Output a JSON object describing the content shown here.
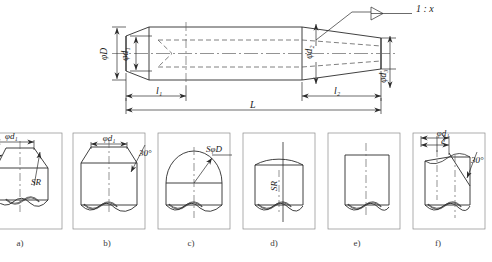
{
  "drawing": {
    "title": "taper-pin-engineering-drawing",
    "line_color": "#2b2b2b",
    "hidden_line_color": "#555555",
    "center_line_color": "#666666",
    "background": "#ffffff"
  },
  "main_view": {
    "name": "taper-pin-main-view",
    "taper_callout": "1 : x",
    "dimensions": {
      "outer_diameter": "φD",
      "left_inner_diameter": "φd₁",
      "right_diameter_2": "φd₂",
      "right_diameter_3": "φd₃",
      "length_left": "l₁",
      "length_right": "l₂",
      "overall_length": "L"
    }
  },
  "detail_views": [
    {
      "id": "a",
      "caption": "a)",
      "labels": [
        "φd₁",
        "SR"
      ],
      "description": "chamfered-end-with-spherical-radius"
    },
    {
      "id": "b",
      "caption": "b)",
      "labels": [
        "φd₁",
        "30°"
      ],
      "description": "chamfered-flat-end"
    },
    {
      "id": "c",
      "caption": "c)",
      "labels": [
        "SφD"
      ],
      "description": "hemispherical-end"
    },
    {
      "id": "d",
      "caption": "d)",
      "labels": [
        "SR"
      ],
      "description": "crowned-spherical-end"
    },
    {
      "id": "e",
      "caption": "e)",
      "labels": [],
      "description": "plain-flat-end"
    },
    {
      "id": "f",
      "caption": "f)",
      "labels": [
        "φd₁",
        "e",
        "30°"
      ],
      "description": "oblique-cut-end"
    }
  ]
}
